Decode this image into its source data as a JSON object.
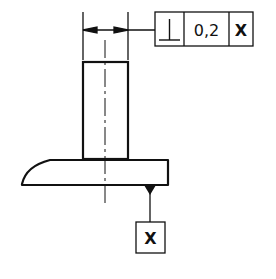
{
  "drawing": {
    "type": "technical-drawing",
    "feature_control_frame": {
      "symbol": "⊥",
      "symbol_name": "perpendicularity",
      "tolerance": "0,2",
      "datum": "X"
    },
    "datum_label": "X",
    "colors": {
      "line": "#111111",
      "background": "#ffffff"
    }
  }
}
